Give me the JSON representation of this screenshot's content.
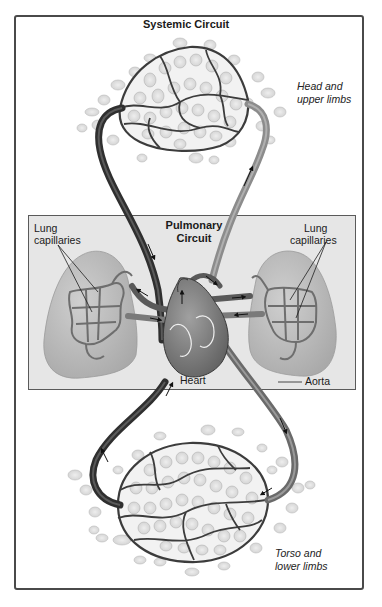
{
  "title": "Systemic Circuit",
  "pulmonary": {
    "title_line1": "Pulmonary",
    "title_line2": "Circuit"
  },
  "labels": {
    "head_line1": "Head and",
    "head_line2": "upper limbs",
    "torso_line1": "Torso and",
    "torso_line2": "lower limbs",
    "lung_left_line1": "Lung",
    "lung_left_line2": "capillaries",
    "lung_right_line1": "Lung",
    "lung_right_line2": "capillaries",
    "heart": "Heart",
    "aorta": "Aorta"
  },
  "colors": {
    "frame": "#4a4a4a",
    "pulmonary_bg": "#e6e6e6",
    "vein_dark": "#3a3a3a",
    "artery_light": "#8c8c8c",
    "lung_fill": "#bdbdbd",
    "cell_fill": "#e2e2e2",
    "capillary": "#4d4d4d"
  }
}
